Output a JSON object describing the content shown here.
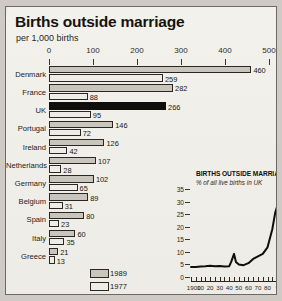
{
  "header": {
    "title": "Births outside marriage",
    "subtitle": "per 1,000 births"
  },
  "legend": {
    "items": [
      {
        "label": "1989",
        "key": "s1989"
      },
      {
        "label": "1977",
        "key": "s1977"
      }
    ]
  },
  "chart_data": {
    "type": "bar",
    "title": "Births outside marriage",
    "subtitle": "per 1,000 births",
    "orientation": "horizontal",
    "grid": false,
    "legend_position": "bottom",
    "xlabel": "",
    "ylabel": "",
    "xlim": [
      0,
      500
    ],
    "xticks": [
      0,
      100,
      200,
      300,
      400,
      500
    ],
    "categories": [
      "Denmark",
      "France",
      "UK",
      "Portugal",
      "Ireland",
      "Netherlands",
      "Germany",
      "Belgium",
      "Spain",
      "Italy",
      "Greece"
    ],
    "series": [
      {
        "name": "1989",
        "values": [
          460,
          282,
          266,
          146,
          126,
          107,
          102,
          89,
          80,
          60,
          21
        ]
      },
      {
        "name": "1977",
        "values": [
          259,
          88,
          95,
          72,
          42,
          28,
          65,
          31,
          23,
          35,
          13
        ]
      }
    ],
    "highlight": {
      "category": "UK",
      "series": "1989",
      "style": "solid-black"
    }
  },
  "inset_chart": {
    "type": "line",
    "title": "BIRTHS OUTSIDE MARRIAGE",
    "subtitle": "% of all live births in UK",
    "xlabel": "",
    "ylabel": "",
    "ylim": [
      0,
      35
    ],
    "yticks": [
      0,
      5,
      10,
      15,
      20,
      25,
      30,
      35
    ],
    "xlim": [
      1900,
      1992
    ],
    "xticks": [
      1900,
      1910,
      1920,
      1930,
      1940,
      1950,
      1960,
      1970,
      1980,
      1992
    ],
    "xticklabels": [
      "1900",
      "10",
      "20",
      "30",
      "40",
      "50",
      "60",
      "70",
      "80",
      "92"
    ],
    "x": [
      1900,
      1905,
      1910,
      1915,
      1920,
      1925,
      1930,
      1935,
      1940,
      1942,
      1945,
      1947,
      1950,
      1955,
      1960,
      1965,
      1970,
      1975,
      1980,
      1985,
      1988,
      1990,
      1992
    ],
    "values": [
      4.0,
      4.0,
      4.2,
      4.3,
      4.5,
      4.3,
      4.4,
      4.2,
      4.3,
      6.0,
      9.2,
      6.0,
      5.0,
      4.7,
      5.5,
      7.2,
      8.2,
      9.2,
      11.8,
      19.0,
      25.5,
      28.0,
      31.2
    ],
    "series_name": "% of all live births in UK"
  }
}
